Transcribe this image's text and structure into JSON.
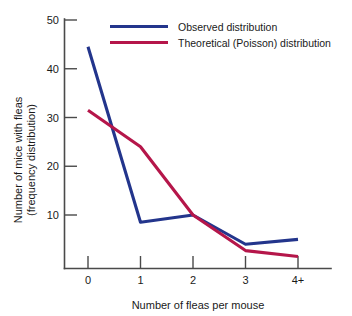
{
  "chart_data": {
    "type": "line",
    "title": "",
    "xlabel": "Number of fleas per mouse",
    "ylabel_line1": "Number of mice with fleas",
    "ylabel_line2": "(frequency distribution)",
    "categories": [
      "0",
      "1",
      "2",
      "3",
      "4+"
    ],
    "xticks": [
      "0",
      "1",
      "2",
      "3",
      "4+"
    ],
    "yticks": [
      "10",
      "20",
      "30",
      "40",
      "50"
    ],
    "ytick_values": [
      10,
      20,
      30,
      40,
      50
    ],
    "ylim": [
      0,
      52
    ],
    "grid": false,
    "legend_position": "top-right",
    "series": [
      {
        "name": "Observed distribution",
        "color": "#23358c",
        "values": [
          44.5,
          8.5,
          10,
          4,
          5
        ]
      },
      {
        "name": "Theoretical (Poisson) distribution",
        "color": "#b5164a",
        "values": [
          31.5,
          24,
          10,
          2.7,
          1.5
        ]
      }
    ]
  },
  "legend": {
    "items": [
      {
        "label": "Observed distribution",
        "color": "#23358c"
      },
      {
        "label": "Theoretical (Poisson) distribution",
        "color": "#b5164a"
      }
    ]
  },
  "axes": {
    "x_title": "Number of fleas per mouse",
    "y_title_line1": "Number of mice with fleas",
    "y_title_line2": "(frequency distribution)",
    "x_tick_labels": [
      "0",
      "1",
      "2",
      "3",
      "4+"
    ],
    "y_tick_labels": [
      "50",
      "40",
      "30",
      "20",
      "10"
    ]
  },
  "colors": {
    "observed": "#23358c",
    "theoretical": "#b5164a",
    "axis": "#4a4a4a",
    "text": "#1a1a1a",
    "background": "#ffffff"
  }
}
